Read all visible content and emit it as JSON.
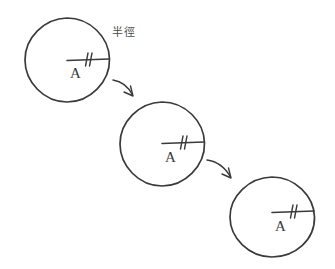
{
  "diagram": {
    "background_color": "#ffffff",
    "ink_color": "#3a3a3a",
    "annotation_color": "#4a4a4a",
    "annotations": [
      {
        "id": "radius-term",
        "text": "半徑",
        "meaning": "radius",
        "x": 112,
        "y": 27
      }
    ],
    "circles": [
      {
        "id": "circle-1",
        "center_label": "A",
        "cx": 67,
        "cy": 60,
        "r": 42,
        "radius_line": {
          "from_x": 67,
          "from_y": 60,
          "to_x": 109,
          "to_y": 59,
          "tick_count": 2,
          "tick_x": 90
        },
        "label_x": 70,
        "label_y": 78
      },
      {
        "id": "circle-2",
        "center_label": "A",
        "cx": 162,
        "cy": 144,
        "r": 42,
        "radius_line": {
          "from_x": 162,
          "from_y": 143,
          "to_x": 204,
          "to_y": 142,
          "tick_count": 2,
          "tick_x": 185,
          "tick_x_alt": 188
        },
        "label_x": 165,
        "label_y": 162
      },
      {
        "id": "circle-3",
        "center_label": "A",
        "cx": 272,
        "cy": 218,
        "r": 42,
        "radius_line": {
          "from_x": 272,
          "from_y": 212,
          "to_x": 314,
          "to_y": 211,
          "tick_count": 2,
          "tick_x": 295
        },
        "label_x": 275,
        "label_y": 230
      }
    ],
    "arrows": [
      {
        "id": "arrow-1",
        "from": "circle-1",
        "to": "circle-2",
        "start_x": 113,
        "start_y": 80,
        "ctrl_x": 125,
        "ctrl_y": 83,
        "end_x": 133,
        "end_y": 95
      },
      {
        "id": "arrow-2",
        "from": "circle-2",
        "to": "circle-3",
        "start_x": 207,
        "start_y": 160,
        "ctrl_x": 221,
        "ctrl_y": 163,
        "end_x": 231,
        "end_y": 177
      }
    ]
  }
}
